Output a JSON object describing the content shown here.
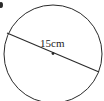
{
  "diagram": {
    "shape": "circle",
    "diameter_label": "15cm",
    "stroke_color": "#2a2a2a",
    "background": "#ffffff"
  }
}
